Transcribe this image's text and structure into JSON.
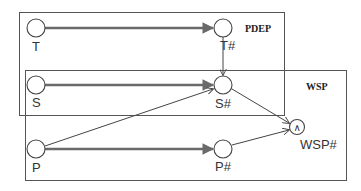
{
  "diagram": {
    "groups": [
      {
        "id": "pdep",
        "label": "PDEP"
      },
      {
        "id": "wsp",
        "label": "WSP"
      }
    ],
    "nodes": [
      {
        "id": "T",
        "label": "T"
      },
      {
        "id": "S",
        "label": "S"
      },
      {
        "id": "P",
        "label": "P"
      },
      {
        "id": "T#",
        "label": "T#"
      },
      {
        "id": "S#",
        "label": "S#"
      },
      {
        "id": "P#",
        "label": "P#"
      },
      {
        "id": "WSP#",
        "label": "WSP#",
        "symbol": "∧"
      }
    ],
    "edges": [
      {
        "from": "T",
        "to": "T#",
        "style": "thick"
      },
      {
        "from": "S",
        "to": "S#",
        "style": "thick"
      },
      {
        "from": "P",
        "to": "P#",
        "style": "thick"
      },
      {
        "from": "T#",
        "to": "S#",
        "style": "thin"
      },
      {
        "from": "P",
        "to": "S#",
        "style": "thin"
      },
      {
        "from": "S#",
        "to": "WSP#",
        "style": "thin"
      },
      {
        "from": "P#",
        "to": "WSP#",
        "style": "thin"
      }
    ],
    "colors": {
      "line": "#444444",
      "thick_line": "#6a6a6a",
      "background": "#ffffff"
    }
  }
}
